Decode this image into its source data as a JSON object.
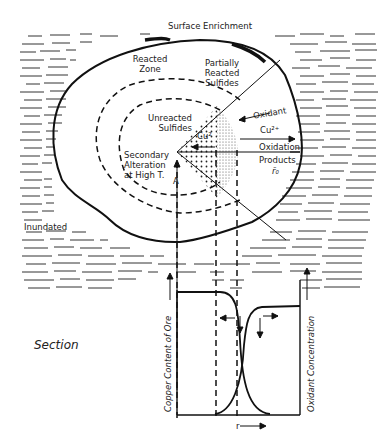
{
  "figure": {
    "labels": {
      "surface_enrichment": "Surface Enrichment",
      "reacted_zone_1": "Reacted",
      "reacted_zone_2": "Zone",
      "partially_1": "Partially",
      "partially_2": "Reacted",
      "partially_3": "Sulfides",
      "unreacted_1": "Unreacted",
      "unreacted_2": "Sulfides",
      "secondary_1": "Secondary",
      "secondary_2": "Alteration",
      "secondary_3": "at High T.",
      "point_a": "A",
      "cu_inner": "Cu²",
      "oxidant": "Oxidant",
      "cu_outer": "Cu²⁺",
      "oxidation": "Oxidation",
      "products": "Products",
      "r0": "r̄₀",
      "inundated": "Inundated",
      "section": "Section",
      "y_left": "Copper Content of Ore",
      "y_right": "Oxidant Concentration",
      "x_axis": "r"
    },
    "colors": {
      "ink": "#1a1a1a",
      "background": "#ffffff"
    }
  }
}
